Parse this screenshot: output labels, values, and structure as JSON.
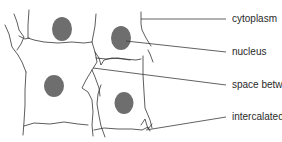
{
  "diagram": {
    "colors": {
      "outline": "#333333",
      "nucleus": "#6e6e6e",
      "leader_line": "#3a3a3a",
      "label_text": "#2a2a2a"
    },
    "labels": [
      {
        "id": "cytoplasm",
        "text": "cytoplasm",
        "x": 232,
        "y": 13
      },
      {
        "id": "nucleus",
        "text": "nucleus",
        "x": 232,
        "y": 46
      },
      {
        "id": "space-between-fibres",
        "text": "space between fibres",
        "x": 232,
        "y": 79
      },
      {
        "id": "intercalated-disc",
        "text": "intercalated disc",
        "x": 232,
        "y": 113
      }
    ]
  }
}
